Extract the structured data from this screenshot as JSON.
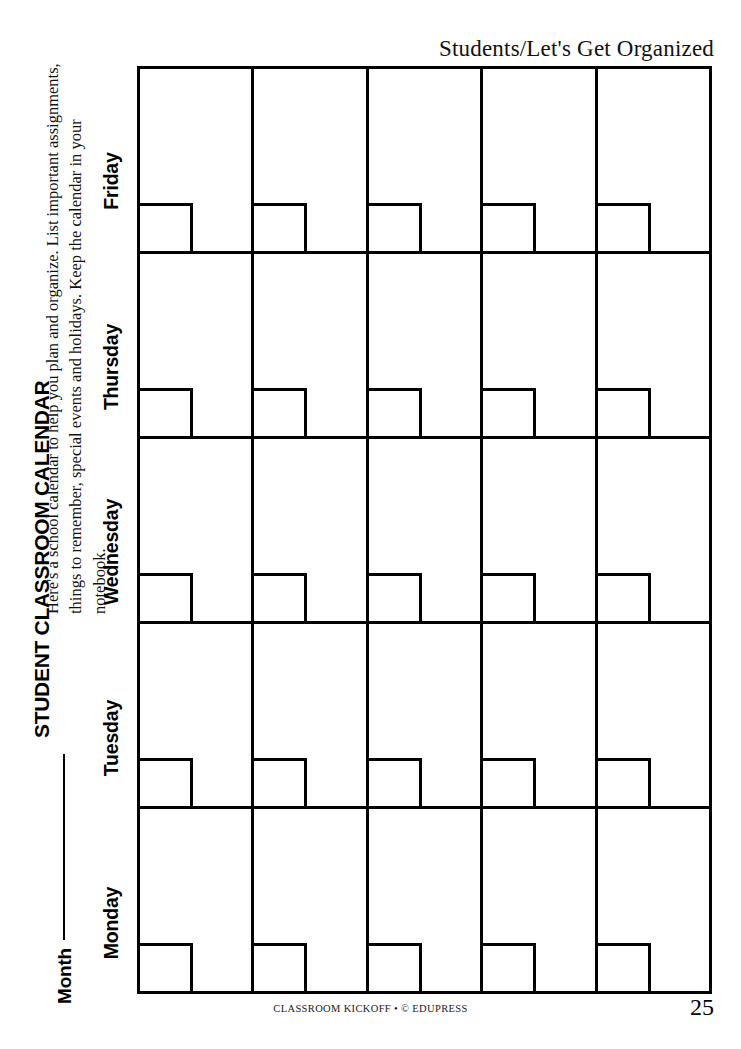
{
  "header": {
    "section_title": "Students/Let's Get Organized"
  },
  "worksheet": {
    "title": "STUDENT CLASSROOM CALENDAR",
    "month_label": "Month",
    "month_value": "",
    "instructions": "Here's a school calendar to help you plan and organize. List important assignments, things to remember, special events and holidays. Keep the calendar in your notebook."
  },
  "calendar": {
    "day_labels": [
      "Friday",
      "Thursday",
      "Wednesday",
      "Tuesday",
      "Monday"
    ],
    "columns": 5,
    "rows": 5,
    "cells": [
      [
        {
          "date": ""
        },
        {
          "date": ""
        },
        {
          "date": ""
        },
        {
          "date": ""
        },
        {
          "date": ""
        }
      ],
      [
        {
          "date": ""
        },
        {
          "date": ""
        },
        {
          "date": ""
        },
        {
          "date": ""
        },
        {
          "date": ""
        }
      ],
      [
        {
          "date": ""
        },
        {
          "date": ""
        },
        {
          "date": ""
        },
        {
          "date": ""
        },
        {
          "date": ""
        }
      ],
      [
        {
          "date": ""
        },
        {
          "date": ""
        },
        {
          "date": ""
        },
        {
          "date": ""
        },
        {
          "date": ""
        }
      ],
      [
        {
          "date": ""
        },
        {
          "date": ""
        },
        {
          "date": ""
        },
        {
          "date": ""
        },
        {
          "date": ""
        }
      ]
    ]
  },
  "footer": {
    "credit": "CLASSROOM KICKOFF • © EDUPRESS",
    "page_number": "25"
  },
  "colors": {
    "ink": "#000000",
    "paper": "#ffffff"
  }
}
